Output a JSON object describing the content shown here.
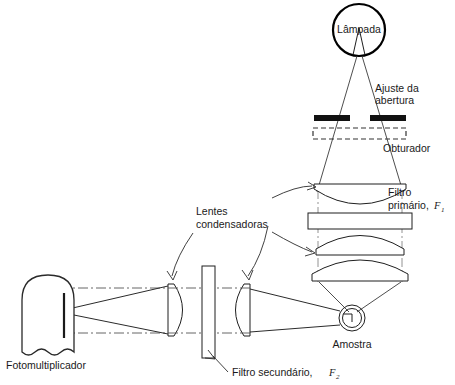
{
  "figure": {
    "language": "pt-BR",
    "background_color": "#ffffff",
    "ink_color": "#1f1f1f"
  },
  "labels": {
    "lamp": "Lâmpada",
    "aperture_line1": "Ajuste da",
    "aperture_line2": "abertura",
    "shutter": "Obturador",
    "primary_filter_line1": "Filtro",
    "primary_filter_line2": "primário,",
    "primary_filter_symbol": "F",
    "primary_filter_subscript": "1",
    "condenser_line1": "Lentes",
    "condenser_line2": "condensadoras",
    "sample": "Amostra",
    "photomultiplier": "Fotomultiplicador",
    "secondary_filter_text": "Filtro secundário,",
    "secondary_filter_symbol": "F",
    "secondary_filter_subscript": "2"
  },
  "components": {
    "lamp": {
      "name": "lamp-source",
      "cx": 359,
      "cy": 30,
      "r": 26
    },
    "aperture": {
      "name": "aperture-stop",
      "left_bar_x": 316,
      "right_bar_x": 366,
      "y": 116,
      "bar_width": 36,
      "bar_height": 6
    },
    "shutter": {
      "name": "shutter",
      "x": 314,
      "y": 128,
      "width": 92,
      "height": 12
    },
    "lens_upper": {
      "name": "collimating-lens",
      "cy": 188
    },
    "primary_filter": {
      "name": "primary-filter",
      "x": 310,
      "y": 213,
      "width": 100,
      "height": 16
    },
    "lens_mid": {
      "name": "focusing-lens-upper",
      "cy": 248
    },
    "lens_lower": {
      "name": "focusing-lens-lower",
      "cy": 272
    },
    "sample": {
      "name": "sample-cuvette",
      "cx": 352,
      "cy": 318,
      "r_outer": 13,
      "r_inner": 9
    },
    "condenser_left": {
      "name": "condenser-lens-left",
      "cx": 178,
      "cy": 310
    },
    "condenser_right": {
      "name": "condenser-lens-right",
      "cx": 243,
      "cy": 310
    },
    "secondary_filter": {
      "name": "secondary-filter",
      "x": 203,
      "y": 268,
      "width": 13,
      "height": 88
    },
    "photomultiplier": {
      "name": "photomultiplier-tube",
      "x": 22,
      "y": 275,
      "width": 52,
      "height": 76
    }
  }
}
